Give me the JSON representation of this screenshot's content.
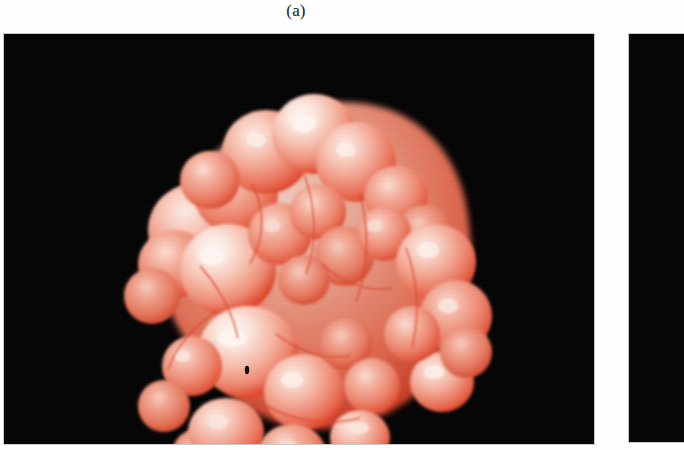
{
  "figure": {
    "caption": "(a)",
    "panels": [
      {
        "id": "panel-a",
        "label": "(a)",
        "background_color": "#050505",
        "content": "molecular-surface-rendering"
      },
      {
        "id": "panel-b",
        "label": "",
        "background_color": "#050505",
        "content": "cropped-adjacent-panel"
      }
    ]
  },
  "render": {
    "subject": "space-filling molecular surface",
    "palette": {
      "background": "#050505",
      "page": "#ffffff",
      "surface_highlight": "#fdeae4",
      "surface_light": "#f8c5b6",
      "surface_mid": "#f0907c",
      "surface_shade": "#e4604a",
      "surface_outline": "#e0452c",
      "surface_deep": "#c23a24",
      "caption_text": "#1a1a1a",
      "panel_border": "#c9c9c9"
    },
    "lighting": {
      "key_light_direction": "upper-left",
      "specular": "white",
      "shading_model": "phong"
    },
    "blob_bounds": {
      "left": 115,
      "top": 78,
      "right": 475,
      "bottom": 420
    },
    "lobes": [
      {
        "cx": 0.418,
        "cy": 0.115,
        "r": 0.092,
        "tone": "light"
      },
      {
        "cx": 0.5,
        "cy": 0.095,
        "r": 0.082,
        "tone": "highlight"
      },
      {
        "cx": 0.56,
        "cy": 0.14,
        "r": 0.078,
        "tone": "light"
      },
      {
        "cx": 0.352,
        "cy": 0.16,
        "r": 0.07,
        "tone": "mid"
      },
      {
        "cx": 0.292,
        "cy": 0.2,
        "r": 0.058,
        "tone": "mid"
      },
      {
        "cx": 0.62,
        "cy": 0.175,
        "r": 0.06,
        "tone": "mid"
      },
      {
        "cx": 0.672,
        "cy": 0.215,
        "r": 0.052,
        "tone": "shade"
      },
      {
        "cx": 0.247,
        "cy": 0.265,
        "r": 0.082,
        "tone": "light"
      },
      {
        "cx": 0.305,
        "cy": 0.33,
        "r": 0.09,
        "tone": "highlight"
      },
      {
        "cx": 0.2,
        "cy": 0.345,
        "r": 0.062,
        "tone": "mid"
      },
      {
        "cx": 0.168,
        "cy": 0.42,
        "r": 0.055,
        "tone": "shade"
      },
      {
        "cx": 0.43,
        "cy": 0.275,
        "r": 0.062,
        "tone": "mid"
      },
      {
        "cx": 0.492,
        "cy": 0.24,
        "r": 0.058,
        "tone": "mid"
      },
      {
        "cx": 0.54,
        "cy": 0.3,
        "r": 0.06,
        "tone": "shade"
      },
      {
        "cx": 0.6,
        "cy": 0.27,
        "r": 0.055,
        "tone": "mid"
      },
      {
        "cx": 0.69,
        "cy": 0.31,
        "r": 0.07,
        "tone": "light"
      },
      {
        "cx": 0.745,
        "cy": 0.38,
        "r": 0.068,
        "tone": "mid"
      },
      {
        "cx": 0.358,
        "cy": 0.43,
        "r": 0.085,
        "tone": "highlight"
      },
      {
        "cx": 0.432,
        "cy": 0.49,
        "r": 0.072,
        "tone": "light"
      },
      {
        "cx": 0.255,
        "cy": 0.47,
        "r": 0.055,
        "tone": "mid"
      },
      {
        "cx": 0.215,
        "cy": 0.53,
        "r": 0.05,
        "tone": "shade"
      },
      {
        "cx": 0.5,
        "cy": 0.42,
        "r": 0.05,
        "tone": "shade"
      },
      {
        "cx": 0.56,
        "cy": 0.47,
        "r": 0.052,
        "tone": "mid"
      },
      {
        "cx": 0.62,
        "cy": 0.52,
        "r": 0.058,
        "tone": "mid"
      },
      {
        "cx": 0.7,
        "cy": 0.47,
        "r": 0.072,
        "tone": "light"
      },
      {
        "cx": 0.76,
        "cy": 0.53,
        "r": 0.05,
        "tone": "shade"
      },
      {
        "cx": 0.3,
        "cy": 0.59,
        "r": 0.07,
        "tone": "light"
      },
      {
        "cx": 0.395,
        "cy": 0.62,
        "r": 0.062,
        "tone": "mid"
      },
      {
        "cx": 0.47,
        "cy": 0.6,
        "r": 0.055,
        "tone": "shade"
      },
      {
        "cx": 0.545,
        "cy": 0.64,
        "r": 0.06,
        "tone": "mid"
      },
      {
        "cx": 0.64,
        "cy": 0.625,
        "r": 0.062,
        "tone": "light"
      },
      {
        "cx": 0.352,
        "cy": 0.7,
        "r": 0.058,
        "tone": "mid"
      },
      {
        "cx": 0.44,
        "cy": 0.73,
        "r": 0.062,
        "tone": "highlight"
      },
      {
        "cx": 0.53,
        "cy": 0.745,
        "r": 0.055,
        "tone": "light"
      },
      {
        "cx": 0.6,
        "cy": 0.71,
        "r": 0.048,
        "tone": "shade"
      },
      {
        "cx": 0.48,
        "cy": 0.805,
        "r": 0.05,
        "tone": "mid"
      },
      {
        "cx": 0.405,
        "cy": 0.8,
        "r": 0.042,
        "tone": "shade"
      },
      {
        "cx": 0.26,
        "cy": 0.66,
        "r": 0.048,
        "tone": "shade"
      }
    ]
  }
}
